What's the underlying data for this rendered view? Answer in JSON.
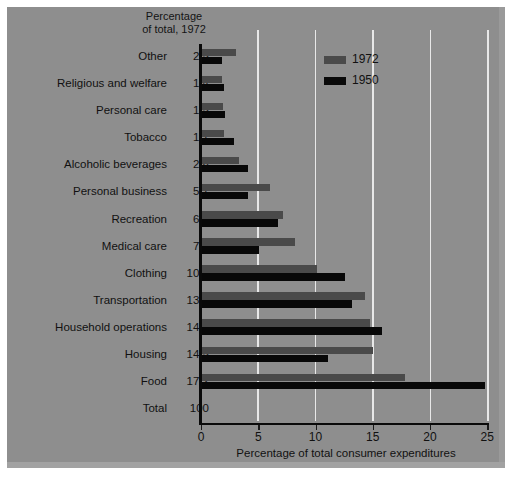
{
  "chart_data": {
    "type": "bar",
    "orientation": "horizontal",
    "title": "",
    "xlabel": "Percentage of total consumer expenditures",
    "ylabel": "",
    "xlim": [
      0,
      25
    ],
    "xticks": [
      0,
      5,
      10,
      15,
      20,
      25
    ],
    "grid": "vertical",
    "legend_position": "top-center",
    "categories": [
      "Other",
      "Religious and welfare",
      "Personal care",
      "Tobacco",
      "Alcoholic beverages",
      "Personal business",
      "Recreation",
      "Medical care",
      "Clothing",
      "Transportation",
      "Household operations",
      "Housing",
      "Food",
      "Total"
    ],
    "series": [
      {
        "name": "1972",
        "color": "#4a4a4a",
        "values": [
          3.1,
          1.8,
          1.9,
          2.0,
          3.3,
          6.0,
          7.2,
          8.2,
          10.1,
          14.3,
          14.8,
          15.0,
          17.8,
          null
        ]
      },
      {
        "name": "1950",
        "color": "#0a0a0a",
        "values": [
          1.8,
          2.0,
          2.1,
          2.9,
          4.1,
          4.1,
          6.7,
          5.1,
          12.6,
          13.2,
          15.8,
          11.1,
          24.8,
          null
        ]
      }
    ],
    "annotation_column": {
      "header_line1": "Percentage",
      "header_line2": "of total, 1972",
      "values": [
        "2.5",
        "1.4",
        "1.5",
        "1.7",
        "2.8",
        "5.7",
        "6.6",
        "7.9",
        "10.0",
        "13.8",
        "14.4",
        "14.5",
        "17.2",
        "100"
      ]
    }
  },
  "legend": {
    "items": [
      {
        "label": "1972",
        "swatch": "legend-swatch-1972"
      },
      {
        "label": "1950",
        "swatch": "legend-swatch-1950"
      }
    ]
  },
  "axis": {
    "tick_labels": [
      "0",
      "5",
      "10",
      "15",
      "20",
      "25"
    ],
    "title": "Percentage of total consumer expenditures"
  },
  "column_header": {
    "line1": "Percentage",
    "line2": "of total, 1972"
  },
  "rows": [
    {
      "label": "Other",
      "value": "2.5",
      "v1972": 3.1,
      "v1950": 1.8
    },
    {
      "label": "Religious and welfare",
      "value": "1.4",
      "v1972": 1.8,
      "v1950": 2.0
    },
    {
      "label": "Personal care",
      "value": "1.5",
      "v1972": 1.9,
      "v1950": 2.1
    },
    {
      "label": "Tobacco",
      "value": "1.7",
      "v1972": 2.0,
      "v1950": 2.9
    },
    {
      "label": "Alcoholic beverages",
      "value": "2.8",
      "v1972": 3.3,
      "v1950": 4.1
    },
    {
      "label": "Personal business",
      "value": "5.7",
      "v1972": 6.0,
      "v1950": 4.1
    },
    {
      "label": "Recreation",
      "value": "6.6",
      "v1972": 7.2,
      "v1950": 6.7
    },
    {
      "label": "Medical care",
      "value": "7.9",
      "v1972": 8.2,
      "v1950": 5.1
    },
    {
      "label": "Clothing",
      "value": "10.0",
      "v1972": 10.1,
      "v1950": 12.6
    },
    {
      "label": "Transportation",
      "value": "13.8",
      "v1972": 14.3,
      "v1950": 13.2
    },
    {
      "label": "Household operations",
      "value": "14.4",
      "v1972": 14.8,
      "v1950": 15.8
    },
    {
      "label": "Housing",
      "value": "14.5",
      "v1972": 15.0,
      "v1950": 11.1
    },
    {
      "label": "Food",
      "value": "17.2",
      "v1972": 17.8,
      "v1950": 24.8
    },
    {
      "label": "Total",
      "value": "100",
      "v1972": null,
      "v1950": null
    }
  ],
  "caption": {
    "text": ""
  },
  "colors": {
    "background": "#8e8e8e",
    "bar_1972": "#4a4a4a",
    "bar_1950": "#0a0a0a",
    "gridline": "#e8e8e8",
    "axis": "#0a0a0a",
    "text": "#111111"
  }
}
